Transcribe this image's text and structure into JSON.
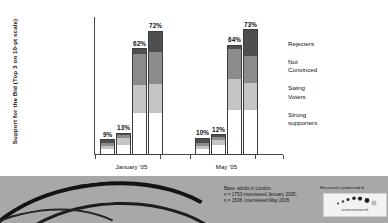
{
  "chart_data": {
    "type": "bar",
    "subtype": "stacked-grouped-column",
    "title": "",
    "xlabel": "",
    "ylabel": "Support for the Bid (Top 3 on 10-pt scale)",
    "ylim": [
      0,
      80
    ],
    "grid": false,
    "legend_position": "right",
    "categories": [
      "January '05",
      "May '05"
    ],
    "legend": [
      "Rejecters",
      "Not Convinced",
      "Swing Voters",
      "Strong supporters"
    ],
    "series_colors": {
      "rejecters": "#4f4f4f",
      "not_convinced": "#8b8b8b",
      "swing_voters": "#c4c4c4",
      "strong_supporters": "#ffffff"
    },
    "groups": [
      {
        "category": "January '05",
        "bars": [
          {
            "total": 9,
            "label": "9%",
            "segments": [
              {
                "name": "Rejecters",
                "value": 2
              },
              {
                "name": "Not Convinced",
                "value": 2
              },
              {
                "name": "Swing Voters",
                "value": 2
              },
              {
                "name": "Strong supporters",
                "value": 3
              }
            ]
          },
          {
            "total": 13,
            "label": "13%",
            "segments": [
              {
                "name": "Rejecters",
                "value": 1
              },
              {
                "name": "Not Convinced",
                "value": 2
              },
              {
                "name": "Swing Voters",
                "value": 4
              },
              {
                "name": "Strong supporters",
                "value": 6
              }
            ]
          },
          {
            "total": 62,
            "label": "62%",
            "segments": [
              {
                "name": "Rejecters",
                "value": 3
              },
              {
                "name": "Not Convinced",
                "value": 18
              },
              {
                "name": "Swing Voters",
                "value": 17
              },
              {
                "name": "Strong supporters",
                "value": 24
              }
            ]
          },
          {
            "total": 72,
            "label": "72%",
            "segments": [
              {
                "name": "Rejecters",
                "value": 12
              },
              {
                "name": "Not Convinced",
                "value": 19
              },
              {
                "name": "Swing Voters",
                "value": 17
              },
              {
                "name": "Strong supporters",
                "value": 24
              }
            ]
          }
        ]
      },
      {
        "category": "May '05",
        "bars": [
          {
            "total": 10,
            "label": "10%",
            "segments": [
              {
                "name": "Rejecters",
                "value": 3
              },
              {
                "name": "Not Convinced",
                "value": 2
              },
              {
                "name": "Swing Voters",
                "value": 2
              },
              {
                "name": "Strong supporters",
                "value": 3
              }
            ]
          },
          {
            "total": 12,
            "label": "12%",
            "segments": [
              {
                "name": "Rejecters",
                "value": 1
              },
              {
                "name": "Not Convinced",
                "value": 2
              },
              {
                "name": "Swing Voters",
                "value": 3
              },
              {
                "name": "Strong supporters",
                "value": 6
              }
            ]
          },
          {
            "total": 64,
            "label": "64%",
            "segments": [
              {
                "name": "Rejecters",
                "value": 2
              },
              {
                "name": "Not Convinced",
                "value": 18
              },
              {
                "name": "Swing Voters",
                "value": 18
              },
              {
                "name": "Strong supporters",
                "value": 26
              }
            ]
          },
          {
            "total": 73,
            "label": "73%",
            "segments": [
              {
                "name": "Rejecters",
                "value": 15
              },
              {
                "name": "Not Convinced",
                "value": 16
              },
              {
                "name": "Swing Voters",
                "value": 16
              },
              {
                "name": "Strong supporters",
                "value": 26
              }
            ]
          }
        ]
      }
    ]
  },
  "legend": {
    "items": [
      {
        "line1": "Rejecters",
        "line2": ""
      },
      {
        "line1": "Not",
        "line2": "Convinced"
      },
      {
        "line1": "Swing",
        "line2": "Voters"
      },
      {
        "line1": "Strong",
        "line2": "supporters"
      }
    ]
  },
  "footer": {
    "base_line1": "Base: adults in London",
    "base_line2": "n = 1753 interviewed January 2005,",
    "base_line3": "n = 1508, interviewed May 2005",
    "research_note": "Research conducted b",
    "logo_word": "icmresearch"
  }
}
